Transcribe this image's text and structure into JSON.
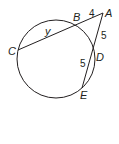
{
  "diagram": {
    "points": {
      "A": "A",
      "B": "B",
      "C": "C",
      "D": "D",
      "E": "E"
    },
    "measures": {
      "AB": "4",
      "BC": "y",
      "AD": "5",
      "DE": "5"
    },
    "colors": {
      "stroke": "#231f20",
      "background": "#ffffff"
    }
  }
}
